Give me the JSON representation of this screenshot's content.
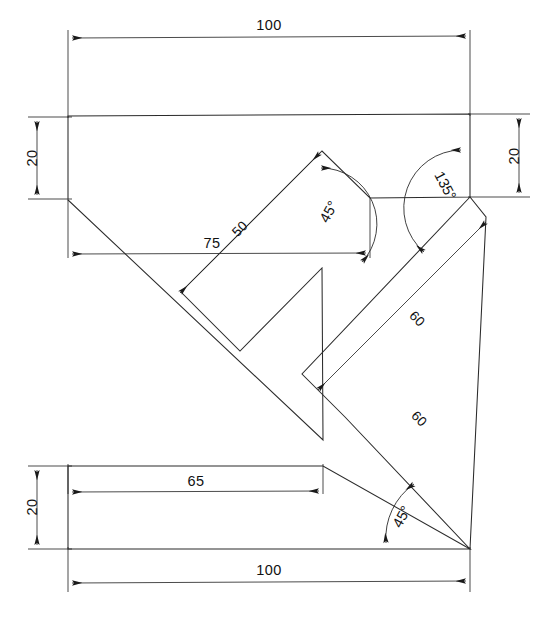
{
  "drawing": {
    "title": "K-shaped bracket orthographic drawing",
    "units": "mm",
    "line_color": "#2b2b2b",
    "background_color": "#ffffff",
    "dimensions": {
      "top_overall_length": "100",
      "top_bar_thickness_left": "20",
      "top_bar_thickness_right": "20",
      "upper_arm_length": "50",
      "upper_inner_horizontal": "75",
      "upper_arm_angle": "45°",
      "elbow_angle": "135°",
      "lower_arm_length_upper": "60",
      "lower_arm_length_outer": "60",
      "lower_arm_angle": "45°",
      "bottom_inner_length": "65",
      "bottom_bar_thickness": "20",
      "bottom_overall_length": "100"
    },
    "labels": [
      {
        "id": "dim-top-100",
        "text": "100",
        "kind": "linear"
      },
      {
        "id": "dim-left-20",
        "text": "20",
        "kind": "linear"
      },
      {
        "id": "dim-right-20",
        "text": "20",
        "kind": "linear"
      },
      {
        "id": "dim-75",
        "text": "75",
        "kind": "linear"
      },
      {
        "id": "dim-50",
        "text": "50",
        "kind": "linear"
      },
      {
        "id": "dim-45-upper",
        "text": "45",
        "kind": "angular",
        "suffix": "°"
      },
      {
        "id": "dim-135",
        "text": "135",
        "kind": "angular",
        "suffix": "°"
      },
      {
        "id": "dim-60-upper",
        "text": "60",
        "kind": "linear"
      },
      {
        "id": "dim-60-lower",
        "text": "60",
        "kind": "linear"
      },
      {
        "id": "dim-45-lower",
        "text": "45",
        "kind": "angular",
        "suffix": "°"
      },
      {
        "id": "dim-65",
        "text": "65",
        "kind": "linear"
      },
      {
        "id": "dim-bottom-20",
        "text": "20",
        "kind": "linear"
      },
      {
        "id": "dim-bottom-100",
        "text": "100",
        "kind": "linear"
      }
    ]
  }
}
